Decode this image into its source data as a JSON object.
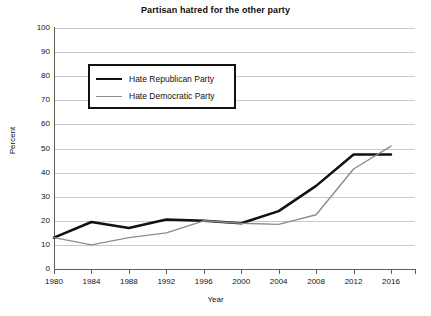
{
  "chart_data": {
    "type": "line",
    "title": "Partisan hatred for the other party",
    "xlabel": "Year",
    "ylabel": "Percent",
    "x": [
      1980,
      1984,
      1988,
      1992,
      1996,
      2000,
      2004,
      2008,
      2012,
      2016
    ],
    "categories": [
      "1980",
      "1984",
      "1988",
      "1992",
      "1996",
      "2000",
      "2004",
      "2008",
      "2012",
      "2016"
    ],
    "xlim": [
      1980,
      2016
    ],
    "ylim": [
      0,
      100
    ],
    "yticks": [
      0,
      10,
      20,
      30,
      40,
      50,
      60,
      70,
      80,
      90,
      100
    ],
    "ytick_labels": [
      "0",
      "10",
      "20",
      "30",
      "40",
      "50",
      "60",
      "70",
      "80",
      "90",
      "100"
    ],
    "grid": "horizontal",
    "legend_position": "upper-left-inside",
    "series": [
      {
        "name": "Hate Republican Party",
        "color": "#111111",
        "width": 2.5,
        "values": [
          13,
          19.5,
          17,
          20.5,
          20,
          19,
          24,
          34.5,
          47.5,
          47.5
        ]
      },
      {
        "name": "Hate Democratic Party",
        "color": "#8c8c8c",
        "width": 1.4,
        "values": [
          13,
          10,
          13,
          15,
          20,
          19,
          18.5,
          22.5,
          41.5,
          51
        ]
      }
    ]
  }
}
